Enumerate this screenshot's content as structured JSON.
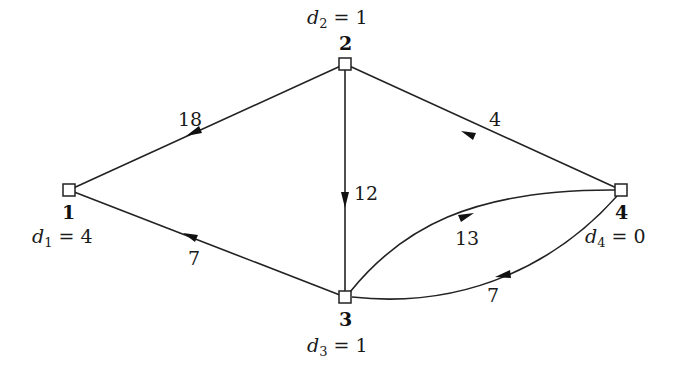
{
  "diagram": {
    "type": "directed-graph",
    "nodes": [
      {
        "id": "1",
        "label": "1",
        "demand_var": "d",
        "demand_sub": "1",
        "demand_eq": "= 4",
        "x": 69,
        "y": 190
      },
      {
        "id": "2",
        "label": "2",
        "demand_var": "d",
        "demand_sub": "2",
        "demand_eq": "= 1",
        "x": 345,
        "y": 64
      },
      {
        "id": "3",
        "label": "3",
        "demand_var": "d",
        "demand_sub": "3",
        "demand_eq": "= 1",
        "x": 345,
        "y": 297
      },
      {
        "id": "4",
        "label": "4",
        "demand_var": "d",
        "demand_sub": "4",
        "demand_eq": "= 0",
        "x": 621,
        "y": 190
      }
    ],
    "edges": [
      {
        "from": "2",
        "to": "1",
        "weight": "18"
      },
      {
        "from": "2",
        "to": "3",
        "weight": "12"
      },
      {
        "from": "4",
        "to": "2",
        "weight": "4"
      },
      {
        "from": "3",
        "to": "1",
        "weight": "7"
      },
      {
        "from": "3",
        "to": "4",
        "weight": "13"
      },
      {
        "from": "4",
        "to": "3",
        "weight": "7"
      }
    ]
  }
}
